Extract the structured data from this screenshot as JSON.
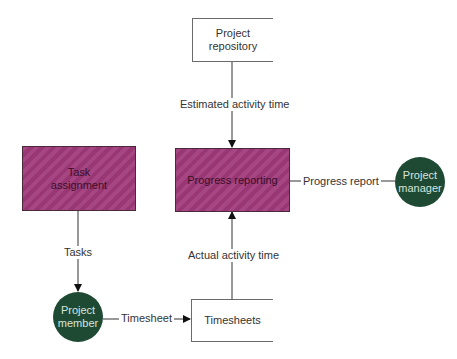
{
  "diagram": {
    "type": "data-flow-diagram",
    "nodes": {
      "project_repository": {
        "label": "Project repository",
        "line1": "Project",
        "line2": "repository",
        "kind": "data-store"
      },
      "task_assignment": {
        "label": "Task assignment",
        "line1": "Task",
        "line2": "assignment",
        "kind": "process"
      },
      "progress_reporting": {
        "label": "Progress reporting",
        "kind": "process"
      },
      "project_manager": {
        "label": "Project manager",
        "line1": "Project",
        "line2": "manager",
        "kind": "external-entity"
      },
      "project_member": {
        "label": "Project member",
        "line1": "Project",
        "line2": "member",
        "kind": "external-entity"
      },
      "timesheets": {
        "label": "Timesheets",
        "kind": "data-store"
      }
    },
    "flows": {
      "estimated_activity_time": {
        "label": "Estimated activity time",
        "from": "Project repository",
        "to": "Progress reporting"
      },
      "progress_report": {
        "label": "Progress report",
        "from": "Progress reporting",
        "to": "Project manager"
      },
      "tasks": {
        "label": "Tasks",
        "from": "Task assignment",
        "to": "Project member"
      },
      "timesheet": {
        "label": "Timesheet",
        "from": "Project member",
        "to": "Timesheets"
      },
      "actual_activity_time": {
        "label": "Actual activity time",
        "from": "Timesheets",
        "to": "Progress reporting"
      }
    },
    "colors": {
      "process_fill": "#a03a7a",
      "entity_fill": "#1e4a34",
      "line": "#333333"
    }
  }
}
